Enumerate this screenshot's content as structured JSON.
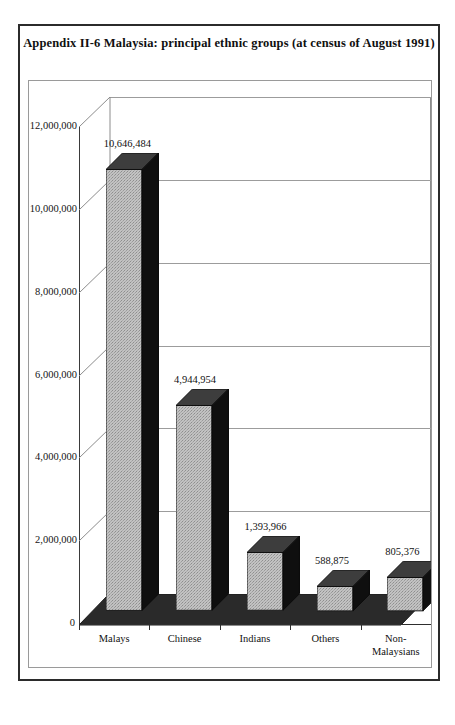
{
  "document": {
    "title": "Appendix II-6 Malaysia: principal ethnic groups (at census of August 1991)"
  },
  "chart_data": {
    "type": "bar",
    "title": "Appendix II-6 Malaysia: principal ethnic groups (at census of August 1991)",
    "xlabel": "",
    "ylabel": "",
    "categories": [
      "Malays",
      "Chinese",
      "Indians",
      "Others",
      "Non-\nMalaysians"
    ],
    "values": [
      10646484,
      4944954,
      1393966,
      588875,
      805376
    ],
    "data_labels": [
      "10,646,484",
      "4,944,954",
      "1,393,966",
      "588,875",
      "805,376"
    ],
    "ylim": [
      0,
      12000000
    ],
    "ytick_values": [
      0,
      2000000,
      4000000,
      6000000,
      8000000,
      10000000,
      12000000
    ],
    "ytick_labels": [
      "0",
      "2,000,000",
      "4,000,000",
      "6,000,000",
      "8,000,000",
      "10,000,000",
      "12,000,000"
    ],
    "grid": true,
    "legend": false,
    "three_d": true,
    "colors": {
      "bar_front": "#b9b9b9",
      "bar_side": "#111111",
      "bar_top": "#3a3a3a",
      "floor": "#2a2a2a",
      "gridline": "#9c9c9c",
      "axis": "#2e2e2e",
      "text": "#111111",
      "frame_outer": "#2b2b2b",
      "frame_inner": "#9a9a9a",
      "background": "#ffffff"
    }
  }
}
